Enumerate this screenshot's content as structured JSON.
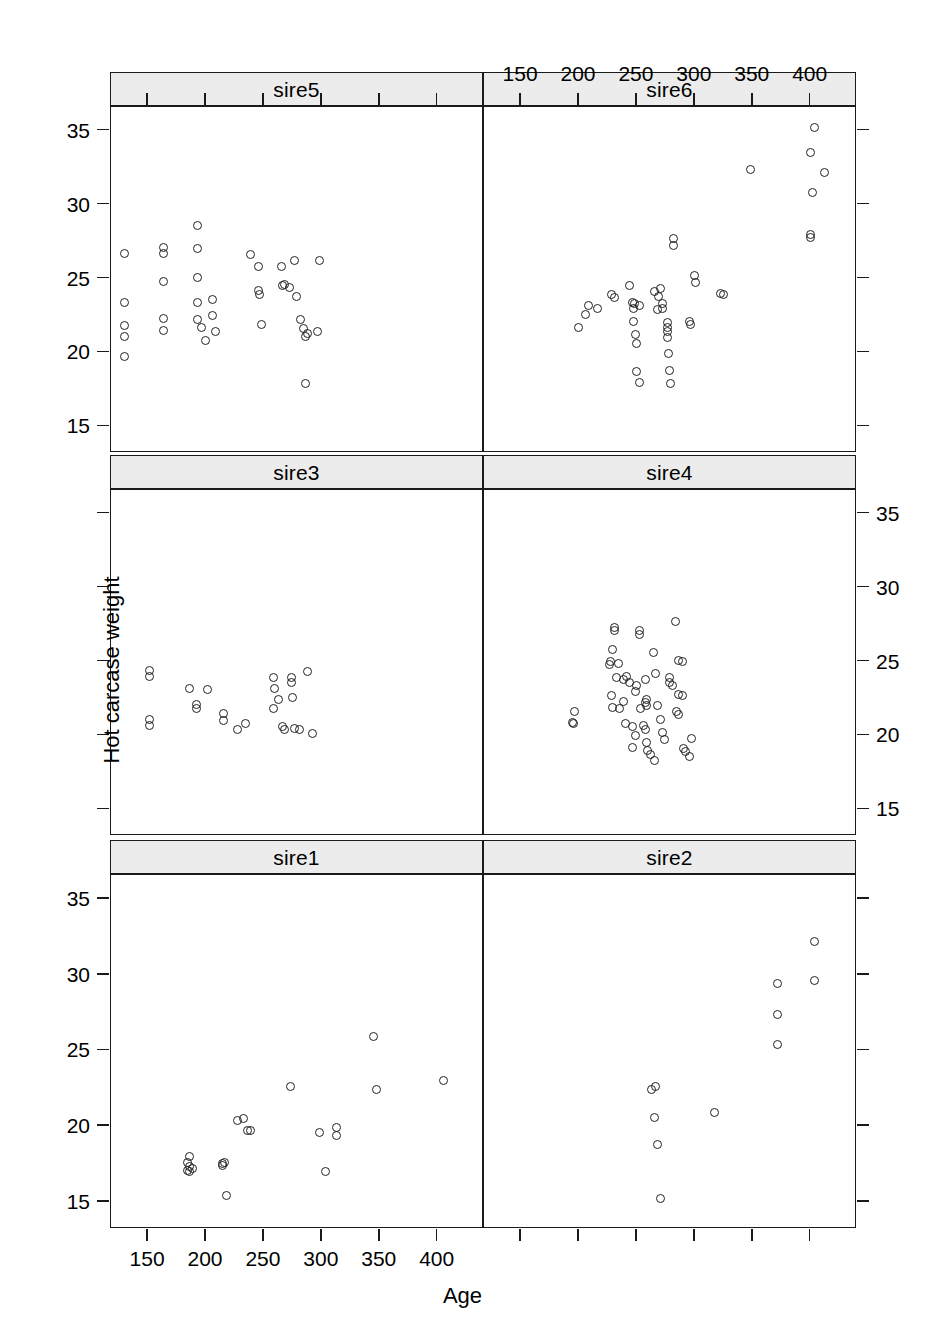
{
  "figure": {
    "x_axis_label": "Age",
    "y_axis_label": "Hot carcase weight",
    "x_ticks": [
      150,
      200,
      250,
      300,
      350,
      400
    ],
    "y_ticks": [
      15,
      20,
      25,
      30,
      35
    ],
    "xlim": [
      118,
      440
    ],
    "ylim": [
      13.2,
      36.6
    ],
    "grid": false,
    "panel_rows": 3,
    "panel_cols": 2,
    "point_symbol": "open-circle",
    "stroke_color": "#222222",
    "strip_fill": "#ececec",
    "border_color": "#1a1a1a"
  },
  "panels": [
    {
      "label": "sire5",
      "row": 0,
      "col": 0,
      "x_axis_position": "top",
      "y_axis_position": "left"
    },
    {
      "label": "sire6",
      "row": 0,
      "col": 1,
      "x_axis_position": "top",
      "y_axis_position": "none"
    },
    {
      "label": "sire3",
      "row": 1,
      "col": 0,
      "x_axis_position": "none",
      "y_axis_position": "none"
    },
    {
      "label": "sire4",
      "row": 1,
      "col": 1,
      "x_axis_position": "none",
      "y_axis_position": "right"
    },
    {
      "label": "sire1",
      "row": 2,
      "col": 0,
      "x_axis_position": "bottom",
      "y_axis_position": "left"
    },
    {
      "label": "sire2",
      "row": 2,
      "col": 1,
      "x_axis_position": "bottom",
      "y_axis_position": "none"
    }
  ],
  "chart_data": {
    "type": "scatter",
    "title": "",
    "xlabel": "Age",
    "ylabel": "Hot carcase weight",
    "xlim": [
      118,
      440
    ],
    "ylim": [
      13.2,
      36.6
    ],
    "xticks": [
      150,
      200,
      250,
      300,
      350,
      400
    ],
    "yticks": [
      15,
      20,
      25,
      30,
      35
    ],
    "grid": false,
    "legend": "none",
    "facet_by": "sire",
    "series": [
      {
        "name": "sire5",
        "n": 38,
        "points": [
          [
            130,
            26.7
          ],
          [
            130,
            23.4
          ],
          [
            130,
            21.8
          ],
          [
            130,
            21.1
          ],
          [
            130,
            19.7
          ],
          [
            163,
            27.1
          ],
          [
            163,
            26.7
          ],
          [
            163,
            24.8
          ],
          [
            163,
            22.3
          ],
          [
            163,
            21.5
          ],
          [
            193,
            28.6
          ],
          [
            193,
            27.0
          ],
          [
            193,
            25.1
          ],
          [
            193,
            23.4
          ],
          [
            193,
            22.2
          ],
          [
            196,
            21.7
          ],
          [
            200,
            20.8
          ],
          [
            206,
            22.5
          ],
          [
            206,
            23.6
          ],
          [
            208,
            21.4
          ],
          [
            238,
            26.6
          ],
          [
            245,
            25.8
          ],
          [
            245,
            24.2
          ],
          [
            246,
            23.9
          ],
          [
            248,
            21.9
          ],
          [
            265,
            25.8
          ],
          [
            266,
            24.5
          ],
          [
            268,
            24.6
          ],
          [
            272,
            24.4
          ],
          [
            276,
            26.2
          ],
          [
            278,
            23.8
          ],
          [
            282,
            22.2
          ],
          [
            284,
            21.6
          ],
          [
            286,
            21.1
          ],
          [
            288,
            21.3
          ],
          [
            296,
            21.4
          ],
          [
            298,
            26.2
          ],
          [
            286,
            17.9
          ]
        ]
      },
      {
        "name": "sire6",
        "n": 44,
        "points": [
          [
            403,
            35.2
          ],
          [
            400,
            33.5
          ],
          [
            348,
            32.4
          ],
          [
            412,
            32.2
          ],
          [
            402,
            30.8
          ],
          [
            400,
            28.0
          ],
          [
            400,
            27.8
          ],
          [
            282,
            27.7
          ],
          [
            282,
            27.2
          ],
          [
            269,
            23.8
          ],
          [
            270,
            24.3
          ],
          [
            272,
            23.3
          ],
          [
            272,
            23.0
          ],
          [
            268,
            22.9
          ],
          [
            265,
            24.1
          ],
          [
            228,
            23.9
          ],
          [
            231,
            23.7
          ],
          [
            216,
            23.0
          ],
          [
            206,
            22.6
          ],
          [
            208,
            23.2
          ],
          [
            200,
            21.7
          ],
          [
            244,
            24.5
          ],
          [
            246,
            23.4
          ],
          [
            248,
            23.3
          ],
          [
            247,
            23.0
          ],
          [
            252,
            23.2
          ],
          [
            247,
            22.1
          ],
          [
            249,
            21.2
          ],
          [
            250,
            20.6
          ],
          [
            300,
            25.2
          ],
          [
            301,
            24.7
          ],
          [
            295,
            22.1
          ],
          [
            296,
            21.9
          ],
          [
            322,
            24.0
          ],
          [
            325,
            23.9
          ],
          [
            276,
            22.0
          ],
          [
            276,
            21.7
          ],
          [
            276,
            21.4
          ],
          [
            276,
            21.0
          ],
          [
            277,
            19.9
          ],
          [
            278,
            18.8
          ],
          [
            279,
            17.9
          ],
          [
            250,
            18.7
          ],
          [
            252,
            18.0
          ]
        ]
      },
      {
        "name": "sire3",
        "n": 25,
        "points": [
          [
            151,
            24.4
          ],
          [
            151,
            24.0
          ],
          [
            151,
            21.1
          ],
          [
            151,
            20.7
          ],
          [
            186,
            23.2
          ],
          [
            192,
            22.1
          ],
          [
            192,
            21.8
          ],
          [
            201,
            23.1
          ],
          [
            215,
            21.5
          ],
          [
            215,
            21.0
          ],
          [
            227,
            20.4
          ],
          [
            234,
            20.8
          ],
          [
            258,
            23.9
          ],
          [
            259,
            23.2
          ],
          [
            258,
            21.8
          ],
          [
            263,
            22.4
          ],
          [
            266,
            20.6
          ],
          [
            268,
            20.4
          ],
          [
            274,
            23.9
          ],
          [
            274,
            23.6
          ],
          [
            275,
            22.6
          ],
          [
            276,
            20.5
          ],
          [
            281,
            20.4
          ],
          [
            288,
            24.3
          ],
          [
            292,
            20.1
          ]
        ]
      },
      {
        "name": "sire4",
        "n": 56,
        "points": [
          [
            196,
            21.6
          ],
          [
            194,
            20.9
          ],
          [
            195,
            20.8
          ],
          [
            231,
            27.3
          ],
          [
            231,
            27.1
          ],
          [
            229,
            25.8
          ],
          [
            227,
            25.0
          ],
          [
            226,
            24.8
          ],
          [
            234,
            24.9
          ],
          [
            232,
            23.9
          ],
          [
            238,
            23.8
          ],
          [
            241,
            24.0
          ],
          [
            244,
            23.6
          ],
          [
            228,
            22.7
          ],
          [
            229,
            21.9
          ],
          [
            235,
            21.8
          ],
          [
            238,
            22.3
          ],
          [
            240,
            20.8
          ],
          [
            246,
            19.2
          ],
          [
            249,
            20.0
          ],
          [
            250,
            23.4
          ],
          [
            252,
            27.1
          ],
          [
            252,
            26.8
          ],
          [
            257,
            23.8
          ],
          [
            258,
            22.0
          ],
          [
            257,
            22.2
          ],
          [
            258,
            22.4
          ],
          [
            253,
            21.8
          ],
          [
            256,
            20.7
          ],
          [
            257,
            20.4
          ],
          [
            258,
            19.5
          ],
          [
            259,
            19.0
          ],
          [
            262,
            18.7
          ],
          [
            265,
            18.3
          ],
          [
            268,
            22.0
          ],
          [
            270,
            21.1
          ],
          [
            272,
            20.2
          ],
          [
            274,
            19.7
          ],
          [
            278,
            23.9
          ],
          [
            278,
            23.6
          ],
          [
            281,
            23.4
          ],
          [
            283,
            27.7
          ],
          [
            286,
            25.1
          ],
          [
            289,
            25.0
          ],
          [
            286,
            22.8
          ],
          [
            289,
            22.7
          ],
          [
            284,
            21.6
          ],
          [
            286,
            21.4
          ],
          [
            290,
            19.1
          ],
          [
            292,
            18.9
          ],
          [
            295,
            18.6
          ],
          [
            297,
            19.8
          ],
          [
            266,
            24.2
          ],
          [
            264,
            25.6
          ],
          [
            249,
            23.0
          ],
          [
            246,
            20.6
          ]
        ]
      },
      {
        "name": "sire1",
        "n": 22,
        "points": [
          [
            345,
            25.9
          ],
          [
            405,
            23.0
          ],
          [
            347,
            22.4
          ],
          [
            273,
            22.6
          ],
          [
            232,
            20.5
          ],
          [
            227,
            20.4
          ],
          [
            236,
            19.7
          ],
          [
            238,
            19.7
          ],
          [
            298,
            19.6
          ],
          [
            313,
            19.9
          ],
          [
            313,
            19.4
          ],
          [
            303,
            17.0
          ],
          [
            186,
            18.0
          ],
          [
            184,
            17.6
          ],
          [
            188,
            17.2
          ],
          [
            184,
            17.1
          ],
          [
            186,
            17.0
          ],
          [
            214,
            17.5
          ],
          [
            214,
            17.4
          ],
          [
            218,
            15.4
          ],
          [
            186,
            17.3
          ],
          [
            216,
            17.6
          ]
        ]
      },
      {
        "name": "sire2",
        "n": 11,
        "points": [
          [
            403,
            32.2
          ],
          [
            403,
            29.6
          ],
          [
            371,
            29.4
          ],
          [
            371,
            27.4
          ],
          [
            371,
            25.4
          ],
          [
            317,
            20.9
          ],
          [
            266,
            22.6
          ],
          [
            263,
            22.4
          ],
          [
            265,
            20.6
          ],
          [
            268,
            18.8
          ],
          [
            270,
            15.2
          ]
        ]
      }
    ]
  }
}
